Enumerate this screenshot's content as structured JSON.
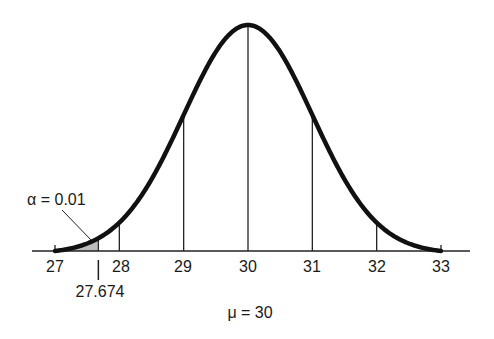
{
  "chart_data": {
    "type": "area",
    "title": "",
    "distribution": {
      "mean": 30,
      "sd": 1.0
    },
    "xlabel": "μ = 30",
    "ylabel": "",
    "xlim": [
      27,
      33
    ],
    "x_ticks": [
      27,
      28,
      29,
      30,
      31,
      32,
      33
    ],
    "vertical_lines_at": [
      28,
      29,
      30,
      31,
      32
    ],
    "shaded_region": {
      "from": 27,
      "to": 27.674,
      "label": "α = 0.01"
    },
    "critical_value": 27.674,
    "grid": false,
    "legend": "none"
  },
  "labels": {
    "ticks": [
      "27",
      "28",
      "29",
      "30",
      "31",
      "32",
      "33"
    ],
    "critical": "27.674",
    "alpha": "α = 0.01",
    "mu": "μ = 30"
  }
}
